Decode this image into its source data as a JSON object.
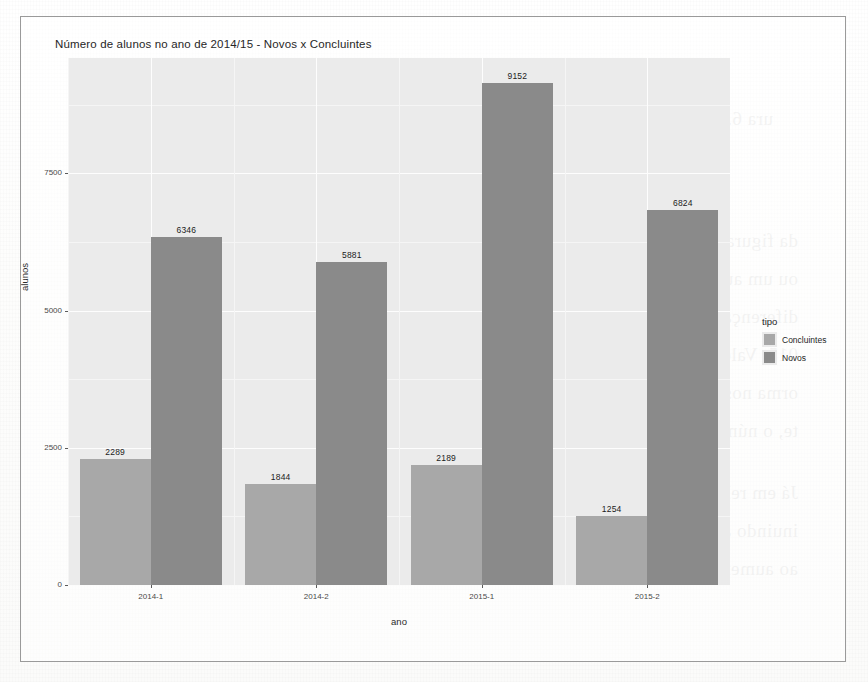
{
  "figure": {
    "title": "Número de alunos no ano de 2014/15 - Novos x Concluintes"
  },
  "legend": {
    "title": "tipo",
    "entries": [
      {
        "label": "Concluintes",
        "color": "#a8a8a8"
      },
      {
        "label": "Novos",
        "color": "#8a8a8a"
      }
    ]
  },
  "axes": {
    "x_title": "ano",
    "y_title": "alunos",
    "y_ticks": [
      "0",
      "2500",
      "5000",
      "7500"
    ],
    "x_ticks": [
      "2014-1",
      "2014-2",
      "2015-1",
      "2015-2"
    ]
  },
  "bleed_text": {
    "l1": "ura 6.5: Comparativo do número de alunos por categoria e",
    "l2": "semestre",
    "l3": "da figura 6.5, observa-se que o número de alunos na última",
    "l4": "ou um aumento sempre nos anos considerados nas análises, e",
    "l5": "diferença quase 600 alunos no segundo semestre do",
    "l6": "015. Vale lembrar que o ano de 2015 foi marcado por greve e",
    "l7": "orma nos Institutos Federais, ma o mais à Iniciativa Inclusiva, que exp",
    "l8": "te, o número de alunos.",
    "l9": "Já em relação aos número de concluintes, verifica-se que ao",
    "l10": "inuindo ao longo dos semestres, o que aponta uma certa preo",
    "l11": "ao aumento de alunos novos observado no mesmo período."
  },
  "chart_data": {
    "type": "bar",
    "title": "Número de alunos no ano de 2014/15 - Novos x Concluintes",
    "xlabel": "ano",
    "ylabel": "alunos",
    "ylim": [
      0,
      9600
    ],
    "grid": true,
    "legend_position": "right",
    "legend_title": "tipo",
    "categories": [
      "2014-1",
      "2014-2",
      "2015-1",
      "2015-2"
    ],
    "series": [
      {
        "name": "Concluintes",
        "color": "#a8a8a8",
        "values": [
          2289,
          1844,
          2189,
          1254
        ]
      },
      {
        "name": "Novos",
        "color": "#8a8a8a",
        "values": [
          6346,
          5881,
          9152,
          6824
        ]
      }
    ]
  }
}
